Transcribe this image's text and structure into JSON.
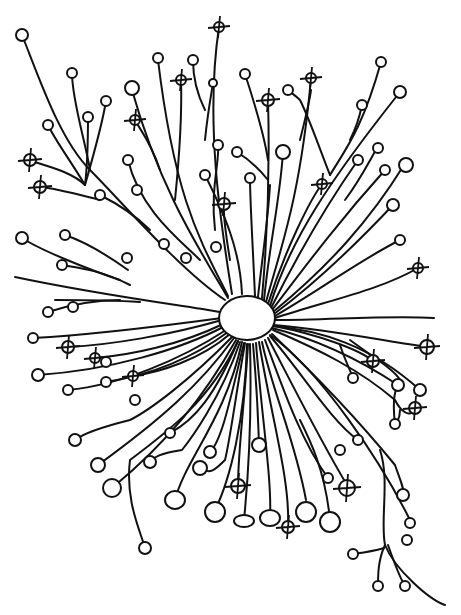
{
  "figure": {
    "stroke_color": "#111111",
    "background": "#ffffff",
    "soma": {
      "cx": 247,
      "cy": 318,
      "rx": 28,
      "ry": 22
    },
    "marked_terminal_count": 22
  }
}
